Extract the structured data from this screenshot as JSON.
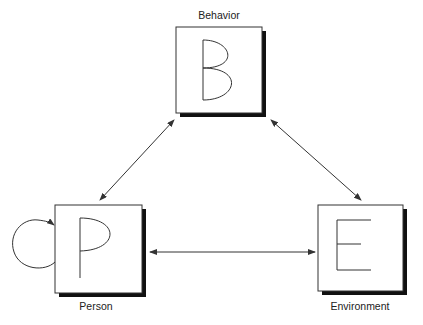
{
  "diagram": {
    "nodes": [
      {
        "id": "B",
        "letter": "B",
        "label": "Behavior",
        "x": 176,
        "y": 27,
        "w": 86,
        "h": 86
      },
      {
        "id": "P",
        "letter": "P",
        "label": "Person",
        "x": 55,
        "y": 205,
        "w": 87,
        "h": 88
      },
      {
        "id": "E",
        "letter": "E",
        "label": "Environment",
        "x": 318,
        "y": 205,
        "w": 85,
        "h": 86
      }
    ],
    "edges": [
      {
        "from": "B",
        "to": "P",
        "type": "bidirectional"
      },
      {
        "from": "B",
        "to": "E",
        "type": "bidirectional"
      },
      {
        "from": "P",
        "to": "E",
        "type": "bidirectional"
      },
      {
        "from": "P",
        "to": "P",
        "type": "self-loop"
      }
    ],
    "colors": {
      "stroke": "#333333",
      "shadow": "#111111",
      "fill": "#ffffff"
    }
  }
}
